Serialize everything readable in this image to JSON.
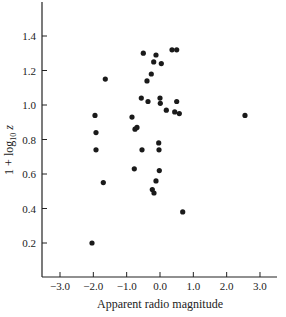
{
  "chart_data": {
    "type": "scatter",
    "title": "",
    "xlabel": "Apparent radio magnitude",
    "ylabel": "1 + log10 z",
    "ylabel_parts": {
      "main": "1 + log",
      "sub": "10",
      "var": " z"
    },
    "xlim": [
      -3.5,
      3.5
    ],
    "ylim": [
      0.0,
      1.6
    ],
    "xticks": [
      -3.0,
      -2.0,
      -1.0,
      0.0,
      1.0,
      2.0,
      3.0
    ],
    "xtick_labels": [
      "−3.0",
      "−2.0",
      "−1.0",
      "0.0",
      "1.0",
      "2.0",
      "3.0"
    ],
    "yticks": [
      0.2,
      0.4,
      0.6,
      0.8,
      1.0,
      1.2,
      1.4
    ],
    "ytick_labels": [
      "0.2",
      "0.4",
      "0.6",
      "0.8",
      "1.0",
      "1.2",
      "1.4"
    ],
    "grid": false,
    "legend": null,
    "marker_color": "#1a1a1a",
    "series": [
      {
        "name": "sources",
        "points": [
          [
            -0.5,
            1.3
          ],
          [
            -0.12,
            1.29
          ],
          [
            0.36,
            1.32
          ],
          [
            0.5,
            1.32
          ],
          [
            -0.19,
            1.25
          ],
          [
            0.04,
            1.24
          ],
          [
            -0.26,
            1.18
          ],
          [
            -0.39,
            1.14
          ],
          [
            -1.64,
            1.15
          ],
          [
            -0.56,
            1.04
          ],
          [
            -0.36,
            1.02
          ],
          [
            0.0,
            1.04
          ],
          [
            0.01,
            1.01
          ],
          [
            0.5,
            1.02
          ],
          [
            0.19,
            0.97
          ],
          [
            0.44,
            0.96
          ],
          [
            0.58,
            0.95
          ],
          [
            2.55,
            0.94
          ],
          [
            -1.95,
            0.94
          ],
          [
            -0.84,
            0.93
          ],
          [
            -1.92,
            0.84
          ],
          [
            -0.75,
            0.86
          ],
          [
            -0.69,
            0.87
          ],
          [
            -0.04,
            0.78
          ],
          [
            -0.03,
            0.74
          ],
          [
            -0.54,
            0.74
          ],
          [
            -1.92,
            0.74
          ],
          [
            -0.77,
            0.63
          ],
          [
            -0.02,
            0.62
          ],
          [
            -0.12,
            0.56
          ],
          [
            -1.7,
            0.55
          ],
          [
            -0.23,
            0.51
          ],
          [
            -0.18,
            0.49
          ],
          [
            0.68,
            0.38
          ],
          [
            -2.04,
            0.2
          ]
        ]
      }
    ]
  }
}
